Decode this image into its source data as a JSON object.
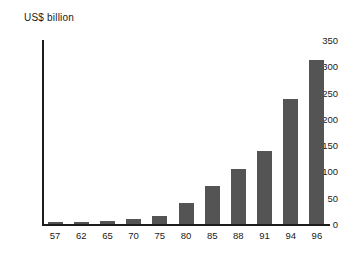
{
  "chart_data": {
    "type": "bar",
    "title": "US$ billion",
    "xlabel": "",
    "ylabel": "US$ billion",
    "categories": [
      "57",
      "62",
      "65",
      "70",
      "75",
      "80",
      "85",
      "88",
      "91",
      "94",
      "96"
    ],
    "values": [
      4,
      4,
      6,
      9,
      16,
      40,
      72,
      104,
      138,
      238,
      312
    ],
    "ylim": [
      0,
      350
    ],
    "yticks": [
      0,
      50,
      100,
      150,
      200,
      250,
      300,
      350
    ],
    "grid": false,
    "legend": false,
    "bar_color": "#545454",
    "axis_color": "#1c1c1c",
    "background_color": "#ffffff",
    "text_color": "#1a1a1a"
  }
}
